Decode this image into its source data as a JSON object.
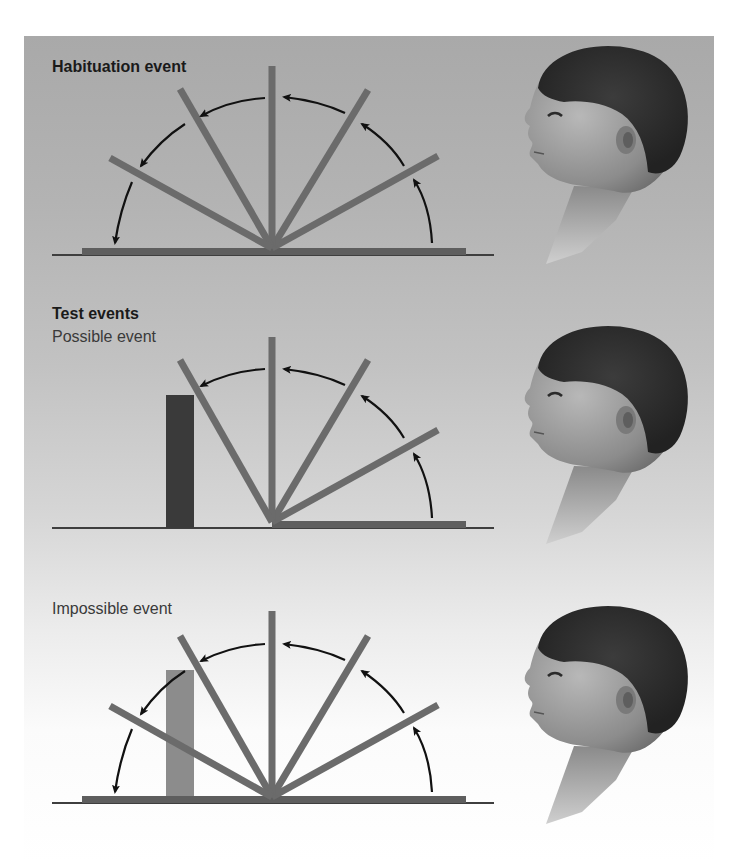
{
  "figure": {
    "panels": [
      {
        "id": "habituation",
        "heading": "Habituation event",
        "subheading": "",
        "screen_angles_deg": [
          0,
          30,
          60,
          90,
          120,
          150,
          180
        ],
        "box": null,
        "infant": "infant-profile-looking-left"
      },
      {
        "id": "possible",
        "heading": "Test events",
        "subheading": "Possible event",
        "screen_angles_deg": [
          0,
          30,
          60,
          90,
          120
        ],
        "box": {
          "shade": "dark",
          "color": "#3a3a3a"
        },
        "infant": "infant-profile-looking-left"
      },
      {
        "id": "impossible",
        "heading": "",
        "subheading": "Impossible event",
        "screen_angles_deg": [
          0,
          30,
          60,
          90,
          120,
          150,
          180
        ],
        "box": {
          "shade": "light",
          "color": "#8c8c8c"
        },
        "infant": "infant-profile-looking-left"
      }
    ],
    "colors": {
      "screen": "#6b6b6b",
      "floor": "#4a4a4a",
      "arrow": "#111111",
      "hair": "#2e2e2e",
      "skin": "#9a9a9a"
    }
  }
}
